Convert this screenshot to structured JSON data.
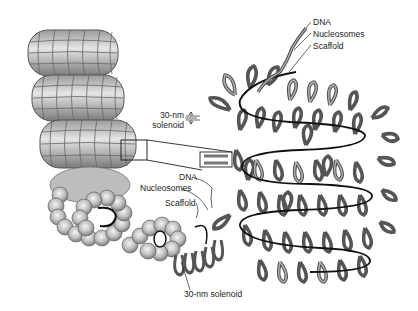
{
  "diagram": {
    "colors": {
      "background": "#ffffff",
      "nucleosome_fill": "#bdbdbd",
      "nucleosome_highlight": "#eeeeee",
      "fiber_outline": "#555555",
      "fiber_fill": "#a8a8a8",
      "scaffold": "#111111",
      "label_text": "#222222"
    },
    "labels": {
      "top_right": {
        "dna": "DNA",
        "nucleosomes": "Nucleosomes",
        "scaffold": "Scaffold"
      },
      "solenoid_width": {
        "line1": "30-nm",
        "line2": "solenoid"
      },
      "middle": {
        "dna": "DNA",
        "nucleosomes": "Nucleosomes",
        "scaffold": "Scaffold"
      },
      "bottom": {
        "solenoid": "30-nm solenoid"
      }
    }
  }
}
